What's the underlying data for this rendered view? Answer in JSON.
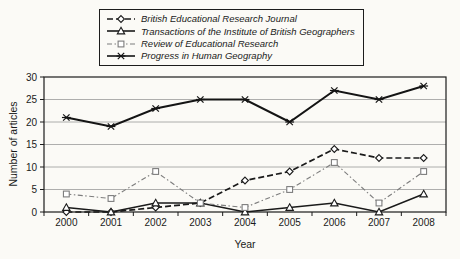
{
  "chart_data": {
    "type": "line",
    "title": "",
    "xlabel": "Year",
    "ylabel": "Number of articles",
    "ylim": [
      0,
      30
    ],
    "yticks": [
      0,
      5,
      10,
      15,
      20,
      25,
      30
    ],
    "grid": true,
    "legend_position": "top-center",
    "categories": [
      "2000",
      "2001",
      "2002",
      "2003",
      "2004",
      "2005",
      "2006",
      "2007",
      "2008"
    ],
    "series": [
      {
        "name": "British Educational Research Journal",
        "marker": "diamond",
        "line": "dashed",
        "color": "#1a1a1a",
        "width": 1.7,
        "values": [
          0,
          0,
          1,
          2,
          7,
          9,
          14,
          12,
          12
        ]
      },
      {
        "name": "Transactions of the Institute of British Geographers",
        "marker": "triangle",
        "line": "solid",
        "color": "#1a1a1a",
        "width": 1.6,
        "values": [
          1,
          0,
          2,
          2,
          0,
          1,
          2,
          0,
          4
        ]
      },
      {
        "name": "Review of Educational Research",
        "marker": "square",
        "line": "dashdot",
        "color": "#7d7d7d",
        "width": 1.1,
        "values": [
          4,
          3,
          9,
          2,
          1,
          5,
          11,
          2,
          9
        ]
      },
      {
        "name": "Progress in Human Geography",
        "marker": "xstar",
        "line": "solid",
        "color": "#141414",
        "width": 2,
        "values": [
          21,
          19,
          23,
          25,
          25,
          20,
          27,
          25,
          28
        ]
      }
    ],
    "colors": {
      "grid": "#9a9a9a",
      "axis": "#1c1c1c",
      "background": "#fbfaf6"
    }
  }
}
